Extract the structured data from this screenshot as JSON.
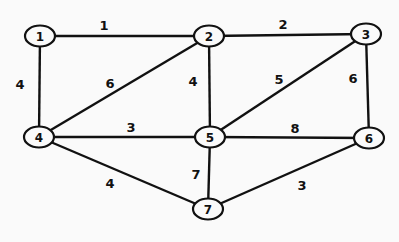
{
  "graph": {
    "nodes": [
      {
        "id": "1",
        "label": "1",
        "x": 40,
        "y": 36
      },
      {
        "id": "2",
        "label": "2",
        "x": 209,
        "y": 36
      },
      {
        "id": "3",
        "label": "3",
        "x": 366,
        "y": 34
      },
      {
        "id": "4",
        "label": "4",
        "x": 39,
        "y": 137
      },
      {
        "id": "5",
        "label": "5",
        "x": 210,
        "y": 137
      },
      {
        "id": "6",
        "label": "6",
        "x": 369,
        "y": 138
      },
      {
        "id": "7",
        "label": "7",
        "x": 208,
        "y": 209
      }
    ],
    "edges": [
      {
        "from": "1",
        "to": "2",
        "weight": "1",
        "lx": 104,
        "ly": 25
      },
      {
        "from": "2",
        "to": "3",
        "weight": "2",
        "lx": 283,
        "ly": 24
      },
      {
        "from": "1",
        "to": "4",
        "weight": "4",
        "lx": 20,
        "ly": 84
      },
      {
        "from": "2",
        "to": "4",
        "weight": "6",
        "lx": 110,
        "ly": 83
      },
      {
        "from": "2",
        "to": "5",
        "weight": "4",
        "lx": 193,
        "ly": 81
      },
      {
        "from": "3",
        "to": "5",
        "weight": "5",
        "lx": 279,
        "ly": 79
      },
      {
        "from": "3",
        "to": "6",
        "weight": "6",
        "lx": 353,
        "ly": 78
      },
      {
        "from": "4",
        "to": "5",
        "weight": "3",
        "lx": 131,
        "ly": 127
      },
      {
        "from": "5",
        "to": "6",
        "weight": "8",
        "lx": 295,
        "ly": 128
      },
      {
        "from": "4",
        "to": "7",
        "weight": "4",
        "lx": 110,
        "ly": 183
      },
      {
        "from": "5",
        "to": "7",
        "weight": "7",
        "lx": 196,
        "ly": 174
      },
      {
        "from": "6",
        "to": "7",
        "weight": "3",
        "lx": 302,
        "ly": 185
      }
    ]
  }
}
